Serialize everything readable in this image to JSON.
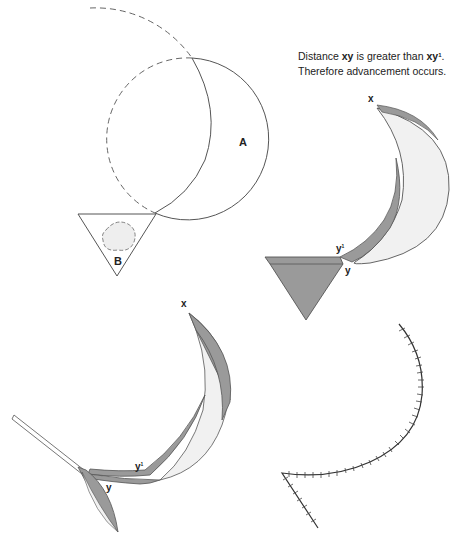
{
  "caption": {
    "line1_prefix": "Distance ",
    "line1_bold1": "xy",
    "line1_mid": " is greater than ",
    "line1_bold2": "xy",
    "line1_sup": "1",
    "line1_suffix": ".",
    "line2": "Therefore advancement occurs."
  },
  "labels": {
    "panel1_circle": "A",
    "panel1_triangle": "B",
    "panel2_x": "x",
    "panel2_y1": "y",
    "panel2_y1_sup": "1",
    "panel2_y": "y",
    "panel3_x": "x",
    "panel3_y1": "y",
    "panel3_y1_sup": "1",
    "panel3_y": "y"
  },
  "colors": {
    "stroke": "#555555",
    "dark_fill": "#9a9a9a",
    "light_fill": "#f1f1f1",
    "hatch": "#333333"
  }
}
